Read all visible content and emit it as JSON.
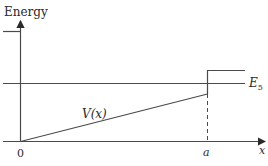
{
  "diagram": {
    "y_axis_label": "Energy",
    "x_axis_label": "x",
    "origin_label": "0",
    "a_label": "a",
    "potential_label": "V(x)",
    "energy_level_label_main": "E",
    "energy_level_label_sub": "5",
    "colors": {
      "line": "#4a4a4a",
      "text": "#2a2a2a",
      "background": "#ffffff"
    }
  }
}
